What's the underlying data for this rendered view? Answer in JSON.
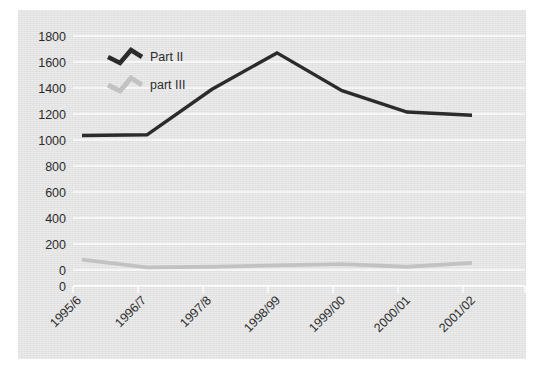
{
  "chart_data": {
    "type": "line",
    "title": "",
    "subtitle": "",
    "xlabel": "",
    "ylabel": "",
    "categories": [
      "1995/6",
      "1996/7",
      "1997/8",
      "1998/99",
      "1999/00",
      "2000/01",
      "2001/02"
    ],
    "series": [
      {
        "name": "Part II",
        "color": "#2b2b2b",
        "values": [
          1035,
          1040,
          1390,
          1670,
          1380,
          1215,
          1190
        ]
      },
      {
        "name": "part III",
        "color": "#c2c2c2",
        "values": [
          80,
          20,
          25,
          35,
          45,
          25,
          55
        ]
      }
    ],
    "ylim": [
      0,
      1800
    ],
    "ytick_labels": [
      "1800",
      "1600",
      "1400",
      "1200",
      "1000",
      "800",
      "600",
      "400",
      "200",
      "0",
      "0"
    ],
    "ytick_values": [
      1800,
      1600,
      1400,
      1200,
      1000,
      800,
      600,
      400,
      200,
      0,
      0
    ],
    "grid": true,
    "gridline_color": "#fbfbfb",
    "legend_position": "top-left",
    "plot_background": "#e3e3e3",
    "figure_background": "#ffffff",
    "xtick_label_rotation": -45
  },
  "legend": {
    "entries": [
      {
        "label": "Part II",
        "color": "#2b2b2b"
      },
      {
        "label": "part III",
        "color": "#c2c2c2"
      }
    ]
  }
}
